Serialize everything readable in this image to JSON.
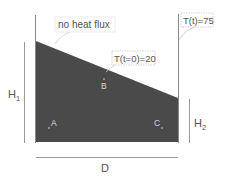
{
  "diagram": {
    "type": "heat-conduction-domain",
    "colors": {
      "domain_fill": "#4a4a4a",
      "line": "#8a8a8a",
      "label_text": "#555555",
      "callout_border": "#c8c8c8",
      "point_label": "#d8d8d8"
    },
    "callouts": {
      "top": "no heat flux",
      "slope": "T(t=0)=20",
      "right": "T(t)=75"
    },
    "dimensions": {
      "left_height": "H",
      "left_height_sub": "1",
      "right_height": "H",
      "right_height_sub": "2",
      "width": "D"
    },
    "points": {
      "a": "A",
      "b": "B",
      "c": "C"
    }
  }
}
